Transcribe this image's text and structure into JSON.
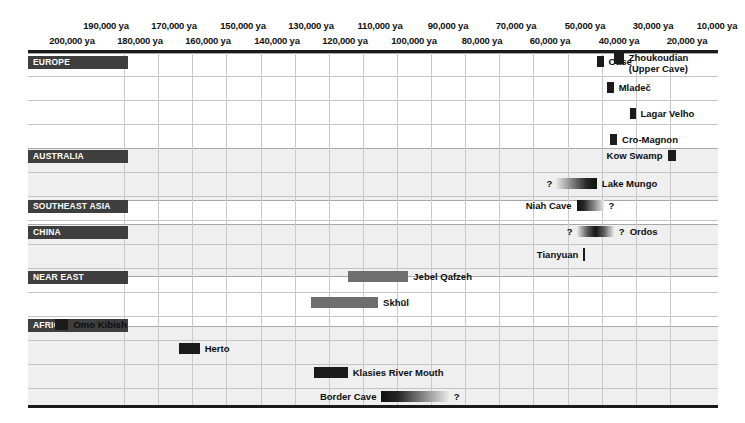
{
  "chart_data": {
    "type": "bar",
    "title": "",
    "xlabel": "",
    "ylabel": "",
    "orientation": "horizontal-timeline",
    "grid": true,
    "legend_position": "none",
    "x_axis": {
      "unit": "ya",
      "xlim": [
        205000,
        0
      ],
      "tick_labels_top": [
        "190,000 ya",
        "170,000 ya",
        "150,000 ya",
        "130,000 ya",
        "110,000 ya",
        "90,000 ya",
        "70,000 ya",
        "50,000 ya",
        "30,000 ya",
        "10,000 ya"
      ],
      "tick_values_top": [
        190000,
        170000,
        150000,
        130000,
        110000,
        90000,
        70000,
        50000,
        30000,
        10000
      ],
      "tick_labels_bottom": [
        "200,000 ya",
        "180,000 ya",
        "160,000 ya",
        "140,000 ya",
        "120,000 ya",
        "100,000 ya",
        "80,000 ya",
        "60,000 ya",
        "40,000 ya",
        "20,000 ya"
      ],
      "tick_values_bottom": [
        200000,
        180000,
        160000,
        140000,
        120000,
        100000,
        80000,
        60000,
        40000,
        20000
      ]
    },
    "regions": [
      {
        "name": "EUROPE",
        "sites": [
          {
            "label": "Oase",
            "start": 36000,
            "end": 34000,
            "style": "solid-dark",
            "label_side": "right",
            "uncertain_start": false,
            "uncertain_end": false
          },
          {
            "label": "Mladeč",
            "start": 33000,
            "end": 31000,
            "style": "solid-dark",
            "label_side": "right",
            "uncertain_start": false,
            "uncertain_end": false
          },
          {
            "label": "Lagar Velho",
            "start": 26000,
            "end": 24500,
            "style": "solid-dark",
            "label_side": "right",
            "uncertain_start": false,
            "uncertain_end": false
          },
          {
            "label": "Cro-Magnon",
            "start": 32000,
            "end": 30000,
            "style": "solid-dark",
            "label_side": "right",
            "uncertain_start": false,
            "uncertain_end": false
          }
        ]
      },
      {
        "name": "AUSTRALIA",
        "sites": [
          {
            "label": "Kow Swamp",
            "start": 15000,
            "end": 12500,
            "style": "solid-dark",
            "label_side": "left",
            "uncertain_start": false,
            "uncertain_end": false
          },
          {
            "label": "Lake Mungo",
            "start": 48000,
            "end": 36000,
            "style": "fade-left",
            "label_side": "right",
            "uncertain_start": true,
            "uncertain_end": false
          }
        ]
      },
      {
        "name": "SOUTHEAST ASIA",
        "sites": [
          {
            "label": "Niah Cave",
            "start": 42000,
            "end": 34000,
            "style": "fade-right",
            "label_side": "left",
            "uncertain_start": false,
            "uncertain_end": true
          }
        ]
      },
      {
        "name": "CHINA",
        "sites": [
          {
            "label": "Ordos",
            "start": 42000,
            "end": 31000,
            "style": "fade-both",
            "label_side": "right",
            "uncertain_start": true,
            "uncertain_end": true
          },
          {
            "label": "Tianyuan",
            "start": 40000,
            "end": 40000,
            "style": "tick-mark",
            "label_side": "left",
            "uncertain_start": false,
            "uncertain_end": false
          },
          {
            "label": "Zhoukoudian (Upper Cave)",
            "start": 31000,
            "end": 28000,
            "style": "solid-dark",
            "label_side": "right",
            "uncertain_start": false,
            "uncertain_end": false
          }
        ]
      },
      {
        "name": "NEAR EAST",
        "sites": [
          {
            "label": "Jebel Qafzeh",
            "start": 110000,
            "end": 92000,
            "style": "solid-mid",
            "label_side": "right",
            "uncertain_start": false,
            "uncertain_end": false
          },
          {
            "label": "Skhūl",
            "start": 121000,
            "end": 101000,
            "style": "solid-mid",
            "label_side": "right",
            "uncertain_start": false,
            "uncertain_end": false
          }
        ]
      },
      {
        "name": "AFRICA",
        "sites": [
          {
            "label": "Omo Kibish",
            "start": 197000,
            "end": 193000,
            "style": "solid-dark",
            "label_side": "right",
            "uncertain_start": false,
            "uncertain_end": false
          },
          {
            "label": "Herto",
            "start": 160000,
            "end": 154000,
            "style": "solid-dark",
            "label_side": "right",
            "uncertain_start": false,
            "uncertain_end": false
          },
          {
            "label": "Klasies River Mouth",
            "start": 120000,
            "end": 110000,
            "style": "solid-dark",
            "label_side": "right",
            "uncertain_start": false,
            "uncertain_end": false
          },
          {
            "label": "Border Cave",
            "start": 100000,
            "end": 80000,
            "style": "fade-right",
            "label_side": "left",
            "uncertain_start": false,
            "uncertain_end": true
          }
        ]
      }
    ],
    "question_marker": "?"
  },
  "layout": {
    "plot_left": 28,
    "plot_top": 53,
    "plot_width": 690,
    "plot_height": 352,
    "tick_x_top": [
      106,
      174,
      243,
      311,
      380,
      448,
      516,
      585,
      653,
      717
    ],
    "tick_x_bottom": [
      72,
      140,
      208,
      277,
      345,
      414,
      482,
      550,
      619,
      687
    ],
    "gridline_x": [
      124,
      158,
      192,
      226,
      261,
      295,
      329,
      363,
      397,
      431,
      465,
      499,
      533,
      568,
      602,
      636,
      670
    ],
    "bands": [
      {
        "top": 0,
        "height": 95,
        "shade": "#ffffff"
      },
      {
        "top": 95,
        "height": 52,
        "shade": "#efefef"
      },
      {
        "top": 147,
        "height": 24,
        "shade": "#ffffff"
      },
      {
        "top": 171,
        "height": 52,
        "shade": "#efefef"
      },
      {
        "top": 223,
        "height": 50,
        "shade": "#ffffff"
      },
      {
        "top": 273,
        "height": 80,
        "shade": "#efefef"
      }
    ],
    "rows": [
      {
        "region": "EUROPE",
        "chip_y": 3,
        "row_ys": [
          3,
          29,
          55,
          81
        ]
      },
      {
        "region": "AUSTRALIA",
        "chip_y": 97,
        "row_ys": [
          97,
          125
        ]
      },
      {
        "region": "SOUTHEAST ASIA",
        "chip_y": 147,
        "row_ys": [
          147
        ]
      },
      {
        "region": "CHINA",
        "chip_y": 173,
        "row_ys": [
          173,
          196
        ]
      },
      {
        "region": "NEAR EAST",
        "chip_y": 218,
        "row_ys": [
          218,
          244
        ]
      },
      {
        "region": "AFRICA",
        "chip_y": 266,
        "row_ys": [
          266,
          290,
          314,
          338
        ]
      }
    ]
  }
}
